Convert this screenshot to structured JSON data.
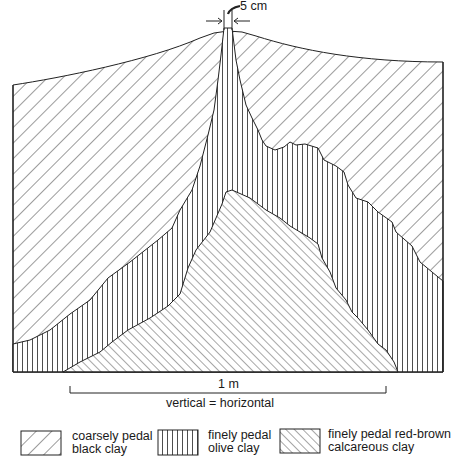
{
  "figure": {
    "type": "soil-profile-cross-section",
    "annotations": {
      "width_marker": "5 cm",
      "scale_bar": "1 m",
      "scale_note": "vertical = horizontal"
    }
  },
  "legend": [
    {
      "pattern": "diagonal-backslash-coarse",
      "line1": "coarsely pedal",
      "line2": "black clay"
    },
    {
      "pattern": "vertical-lines",
      "line1": "finely pedal",
      "line2": "olive clay"
    },
    {
      "pattern": "diagonal-slash-fine",
      "line1": "finely pedal red-brown",
      "line2": "calcareous clay"
    }
  ],
  "colors": {
    "ink": "#1a1a1a",
    "background": "#ffffff"
  }
}
